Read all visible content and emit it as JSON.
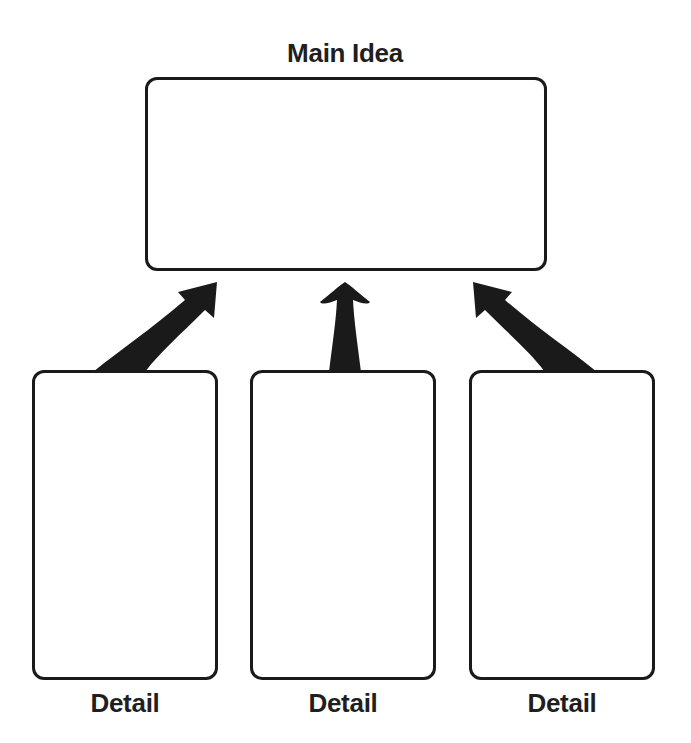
{
  "diagram": {
    "type": "main-idea-and-details graphic organizer",
    "main": {
      "label": "Main Idea"
    },
    "details": [
      {
        "label": "Detail"
      },
      {
        "label": "Detail"
      },
      {
        "label": "Detail"
      }
    ],
    "colors": {
      "stroke": "#1a1a1a",
      "background": "#ffffff",
      "text": "#1f1f1f"
    }
  }
}
